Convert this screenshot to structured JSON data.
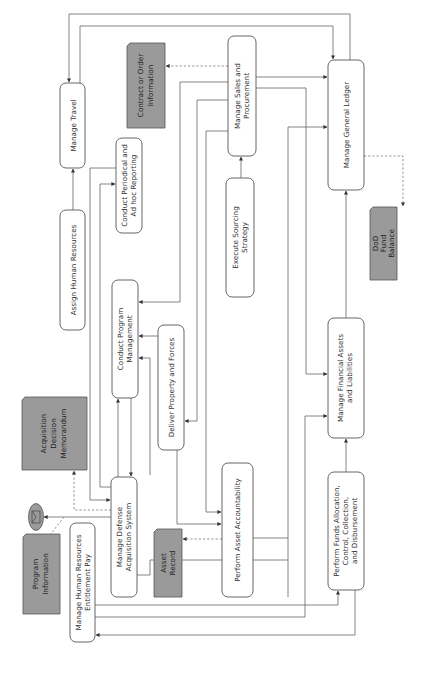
{
  "diagram": {
    "orientation": "rotated-90-ccw",
    "colors": {
      "process_fill": "#ffffff",
      "process_stroke": "#555555",
      "document_fill": "#9a9a9a",
      "line": "#666666",
      "text": "#333333"
    },
    "processes": {
      "manage_travel": {
        "lines": [
          "Manage Travel"
        ]
      },
      "assign_hr": {
        "lines": [
          "Assign Human Resources"
        ]
      },
      "periodic_reporting": {
        "lines": [
          "Conduct Periodical and",
          "Ad hoc Reporting"
        ]
      },
      "sales_procurement": {
        "lines": [
          "Manage Sales and",
          "Procurement"
        ]
      },
      "general_ledger": {
        "lines": [
          "Manage General Ledger"
        ]
      },
      "sourcing": {
        "lines": [
          "Execute Sourcing",
          "Strategy"
        ]
      },
      "program_mgmt": {
        "lines": [
          "Conduct Program",
          "Management"
        ]
      },
      "deliver_property": {
        "lines": [
          "Deliver Property and Forces"
        ]
      },
      "defense_acquisition": {
        "lines": [
          "Manage Defense",
          "Acquisition System"
        ]
      },
      "asset_accountability": {
        "lines": [
          "Perform Asset Accountability"
        ]
      },
      "financial_assets": {
        "lines": [
          "Manage Financial Assets",
          "and Liabilities"
        ]
      },
      "funds_allocation": {
        "lines": [
          "Perform Funds Allocation,",
          "Control, Collection,",
          "and Disbursement"
        ]
      },
      "hr_entitlement_pay": {
        "lines": [
          "Manage Human Resources",
          "Entitlement Pay"
        ]
      }
    },
    "documents": {
      "contract_order": {
        "lines": [
          "Contract or Order",
          "Information"
        ]
      },
      "acquisition_memo": {
        "lines": [
          "Acquisition",
          "Decision",
          "Memorandum"
        ]
      },
      "asset_record": {
        "lines": [
          "Asset",
          "Record"
        ]
      },
      "program_information": {
        "lines": [
          "Program",
          "Information"
        ]
      },
      "dod_fund_balance": {
        "lines": [
          "DoD",
          "Fund",
          "Balance"
        ]
      }
    },
    "icons": {
      "message": "envelope-icon"
    }
  }
}
